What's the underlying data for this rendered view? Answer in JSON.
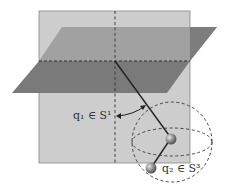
{
  "diagram": {
    "labels": {
      "q1": "q₁ ∈ S¹",
      "q2": "q₂ ∈ S³"
    },
    "colors": {
      "vertical_plane": "#c8c8c8",
      "horizontal_plane": "#7a7a7a",
      "link": "#222222",
      "joint": "#9a9a9a",
      "dashed": "#333333"
    }
  }
}
